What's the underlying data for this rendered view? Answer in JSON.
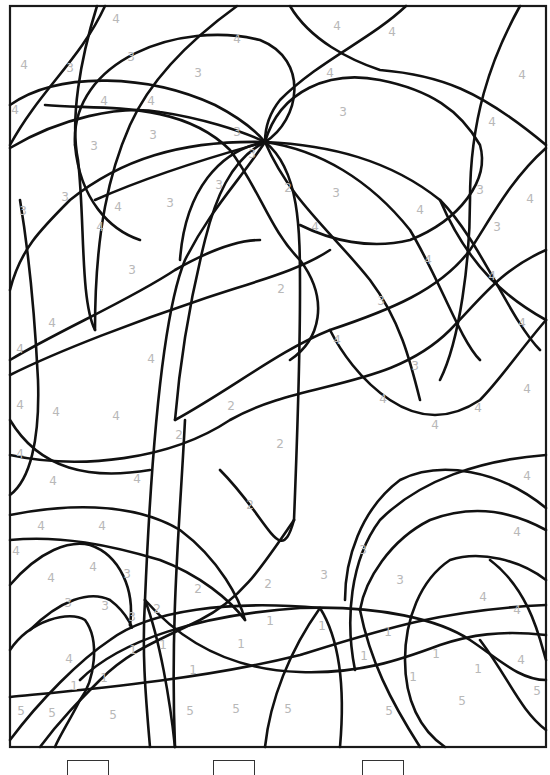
{
  "worksheet": {
    "type": "color-by-number",
    "frame": {
      "x": 10,
      "y": 6,
      "width": 536,
      "height": 741
    },
    "line_color": "#111111",
    "label_color": "#b8b8b8"
  },
  "labels": [
    {
      "t": "4",
      "x": 116,
      "y": 19
    },
    {
      "t": "4",
      "x": 237,
      "y": 39
    },
    {
      "t": "4",
      "x": 337,
      "y": 26
    },
    {
      "t": "4",
      "x": 392,
      "y": 32
    },
    {
      "t": "4",
      "x": 24,
      "y": 65
    },
    {
      "t": "3",
      "x": 70,
      "y": 68
    },
    {
      "t": "3",
      "x": 131,
      "y": 57
    },
    {
      "t": "3",
      "x": 198,
      "y": 73
    },
    {
      "t": "4",
      "x": 330,
      "y": 73
    },
    {
      "t": "4",
      "x": 522,
      "y": 75
    },
    {
      "t": "4",
      "x": 15,
      "y": 110
    },
    {
      "t": "4",
      "x": 104,
      "y": 101
    },
    {
      "t": "4",
      "x": 151,
      "y": 101
    },
    {
      "t": "3",
      "x": 343,
      "y": 112
    },
    {
      "t": "4",
      "x": 492,
      "y": 122
    },
    {
      "t": "3",
      "x": 153,
      "y": 135
    },
    {
      "t": "3",
      "x": 237,
      "y": 132
    },
    {
      "t": "3",
      "x": 94,
      "y": 146
    },
    {
      "t": "3",
      "x": 252,
      "y": 154
    },
    {
      "t": "2",
      "x": 288,
      "y": 188
    },
    {
      "t": "3",
      "x": 336,
      "y": 193
    },
    {
      "t": "3",
      "x": 219,
      "y": 185
    },
    {
      "t": "3",
      "x": 170,
      "y": 203
    },
    {
      "t": "3",
      "x": 480,
      "y": 190
    },
    {
      "t": "4",
      "x": 530,
      "y": 199
    },
    {
      "t": "3",
      "x": 65,
      "y": 197
    },
    {
      "t": "4",
      "x": 118,
      "y": 207
    },
    {
      "t": "3",
      "x": 23,
      "y": 211
    },
    {
      "t": "4",
      "x": 420,
      "y": 210
    },
    {
      "t": "4",
      "x": 315,
      "y": 227
    },
    {
      "t": "4",
      "x": 100,
      "y": 227
    },
    {
      "t": "3",
      "x": 497,
      "y": 227
    },
    {
      "t": "3",
      "x": 132,
      "y": 270
    },
    {
      "t": "4",
      "x": 428,
      "y": 260
    },
    {
      "t": "4",
      "x": 492,
      "y": 276
    },
    {
      "t": "2",
      "x": 281,
      "y": 289
    },
    {
      "t": "3",
      "x": 381,
      "y": 301
    },
    {
      "t": "4",
      "x": 52,
      "y": 323
    },
    {
      "t": "4",
      "x": 522,
      "y": 323
    },
    {
      "t": "4",
      "x": 337,
      "y": 340
    },
    {
      "t": "4",
      "x": 20,
      "y": 349
    },
    {
      "t": "4",
      "x": 151,
      "y": 359
    },
    {
      "t": "3",
      "x": 415,
      "y": 366
    },
    {
      "t": "4",
      "x": 527,
      "y": 389
    },
    {
      "t": "4",
      "x": 383,
      "y": 399
    },
    {
      "t": "4",
      "x": 20,
      "y": 405
    },
    {
      "t": "4",
      "x": 56,
      "y": 412
    },
    {
      "t": "4",
      "x": 116,
      "y": 416
    },
    {
      "t": "2",
      "x": 231,
      "y": 406
    },
    {
      "t": "4",
      "x": 478,
      "y": 408
    },
    {
      "t": "4",
      "x": 435,
      "y": 425
    },
    {
      "t": "2",
      "x": 179,
      "y": 435
    },
    {
      "t": "2",
      "x": 280,
      "y": 444
    },
    {
      "t": "4",
      "x": 20,
      "y": 454
    },
    {
      "t": "4",
      "x": 137,
      "y": 479
    },
    {
      "t": "4",
      "x": 53,
      "y": 481
    },
    {
      "t": "4",
      "x": 527,
      "y": 476
    },
    {
      "t": "2",
      "x": 250,
      "y": 505
    },
    {
      "t": "4",
      "x": 41,
      "y": 526
    },
    {
      "t": "4",
      "x": 102,
      "y": 526
    },
    {
      "t": "4",
      "x": 16,
      "y": 551
    },
    {
      "t": "3",
      "x": 363,
      "y": 550
    },
    {
      "t": "4",
      "x": 517,
      "y": 532
    },
    {
      "t": "4",
      "x": 51,
      "y": 578
    },
    {
      "t": "4",
      "x": 93,
      "y": 567
    },
    {
      "t": "3",
      "x": 127,
      "y": 574
    },
    {
      "t": "3",
      "x": 324,
      "y": 575
    },
    {
      "t": "3",
      "x": 400,
      "y": 580
    },
    {
      "t": "2",
      "x": 198,
      "y": 589
    },
    {
      "t": "2",
      "x": 268,
      "y": 584
    },
    {
      "t": "4",
      "x": 483,
      "y": 597
    },
    {
      "t": "3",
      "x": 68,
      "y": 603
    },
    {
      "t": "3",
      "x": 105,
      "y": 606
    },
    {
      "t": "3",
      "x": 132,
      "y": 617
    },
    {
      "t": "2",
      "x": 157,
      "y": 609
    },
    {
      "t": "4",
      "x": 517,
      "y": 610
    },
    {
      "t": "1",
      "x": 270,
      "y": 621
    },
    {
      "t": "1",
      "x": 322,
      "y": 626
    },
    {
      "t": "1",
      "x": 388,
      "y": 632
    },
    {
      "t": "1",
      "x": 133,
      "y": 650
    },
    {
      "t": "1",
      "x": 163,
      "y": 645
    },
    {
      "t": "1",
      "x": 241,
      "y": 644
    },
    {
      "t": "4",
      "x": 69,
      "y": 659
    },
    {
      "t": "1",
      "x": 364,
      "y": 656
    },
    {
      "t": "1",
      "x": 436,
      "y": 654
    },
    {
      "t": "1",
      "x": 478,
      "y": 669
    },
    {
      "t": "4",
      "x": 521,
      "y": 660
    },
    {
      "t": "1",
      "x": 74,
      "y": 686
    },
    {
      "t": "1",
      "x": 104,
      "y": 678
    },
    {
      "t": "1",
      "x": 193,
      "y": 670
    },
    {
      "t": "1",
      "x": 413,
      "y": 677
    },
    {
      "t": "5",
      "x": 537,
      "y": 691
    },
    {
      "t": "5",
      "x": 21,
      "y": 711
    },
    {
      "t": "5",
      "x": 52,
      "y": 713
    },
    {
      "t": "5",
      "x": 113,
      "y": 715
    },
    {
      "t": "5",
      "x": 190,
      "y": 711
    },
    {
      "t": "5",
      "x": 236,
      "y": 709
    },
    {
      "t": "5",
      "x": 288,
      "y": 709
    },
    {
      "t": "5",
      "x": 389,
      "y": 711
    },
    {
      "t": "5",
      "x": 462,
      "y": 701
    }
  ],
  "color_key": {
    "boxes": [
      {
        "x": 67,
        "label": ""
      },
      {
        "x": 213,
        "label": ""
      },
      {
        "x": 362,
        "label": ""
      }
    ]
  }
}
